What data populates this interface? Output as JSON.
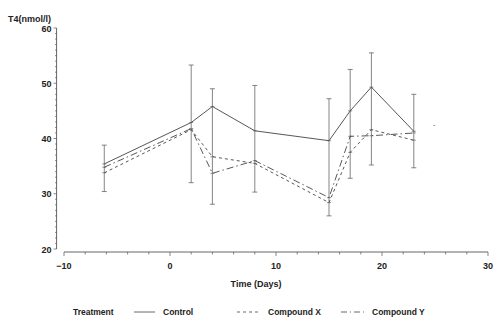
{
  "chart_data": {
    "type": "line",
    "title": "",
    "ylabel": "T4(nmol/l)",
    "xlabel": "Time (Days)",
    "xlim": [
      -10,
      30
    ],
    "ylim": [
      20,
      60
    ],
    "x_ticks": [
      -10,
      0,
      10,
      20,
      30
    ],
    "y_ticks": [
      20,
      30,
      40,
      50,
      60
    ],
    "grid": false,
    "legend_position": "bottom",
    "legend_title": "Treatment",
    "x": [
      -6.2,
      2,
      4,
      8,
      15,
      17,
      19,
      23
    ],
    "series": [
      {
        "name": "Control",
        "style": "solid",
        "values": [
          35.4,
          42.9,
          45.8,
          41.4,
          39.6,
          45.0,
          49.3,
          41.3
        ]
      },
      {
        "name": "Compound X",
        "style": "dashed",
        "values": [
          33.8,
          41.6,
          36.7,
          35.5,
          28.4,
          37.5,
          41.6,
          39.7
        ]
      },
      {
        "name": "Compound Y",
        "style": "dashdot",
        "values": [
          34.8,
          41.8,
          33.7,
          36.0,
          29.3,
          40.4,
          40.5,
          41.0
        ]
      }
    ],
    "error_bars": {
      "x": [
        -6.2,
        2,
        4,
        8,
        15,
        17,
        19,
        23
      ],
      "upper": [
        38.8,
        53.3,
        49.0,
        49.6,
        47.2,
        52.5,
        55.5,
        48.0
      ],
      "lower": [
        30.4,
        32.0,
        28.1,
        30.3,
        26.0,
        32.8,
        35.2,
        34.7
      ]
    }
  },
  "legend": {
    "title": "Treatment",
    "items": [
      "Control",
      "Compound X",
      "Compound Y"
    ]
  },
  "axes": {
    "ylabel": "T4(nmol/l)",
    "xlabel": "Time (Days)",
    "x_tick_labels": [
      "−10",
      "0",
      "10",
      "20",
      "30"
    ],
    "y_tick_labels": [
      "20",
      "30",
      "40",
      "50",
      "60"
    ]
  }
}
